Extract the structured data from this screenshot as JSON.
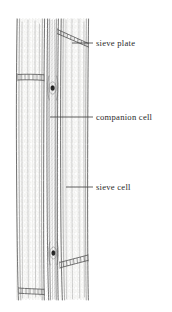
{
  "figure": {
    "background_color": "#ffffff",
    "ink_color": "#4a4a4a",
    "label_color": "#2b2b2b",
    "width": 172,
    "height": 312
  },
  "labels": [
    {
      "id": "sieve-plate",
      "text": "sieve plate",
      "text_x": 96,
      "text_y": 46,
      "leader": {
        "x1": 72,
        "y1": 43,
        "x2": 93,
        "y2": 43
      }
    },
    {
      "id": "companion-cell",
      "text": "companion cell",
      "text_x": 96,
      "text_y": 120,
      "leader": {
        "x1": 50,
        "y1": 117,
        "x2": 93,
        "y2": 117
      }
    },
    {
      "id": "sieve-cell",
      "text": "sieve cell",
      "text_x": 96,
      "text_y": 190,
      "leader": {
        "x1": 66,
        "y1": 187,
        "x2": 93,
        "y2": 187
      }
    }
  ],
  "structures": {
    "left_sieve_cell": {
      "name": "sieve cell (left)",
      "x_range": [
        16,
        45
      ],
      "y_range": [
        18,
        300
      ]
    },
    "companion_cell": {
      "name": "companion cell",
      "x_range": [
        46,
        59
      ],
      "y_range": [
        18,
        300
      ]
    },
    "right_sieve_cell": {
      "name": "sieve cell (right)",
      "x_range": [
        60,
        89
      ],
      "y_range": [
        18,
        300
      ]
    },
    "sieve_plates": [
      {
        "id": "plate-top-right",
        "orientation": "diagonal",
        "x": 58,
        "y": 30
      },
      {
        "id": "plate-upper-left",
        "orientation": "horizontal",
        "x": 18,
        "y": 77
      },
      {
        "id": "plate-lower-right",
        "orientation": "diagonal",
        "x": 60,
        "y": 264
      },
      {
        "id": "plate-bottom-left",
        "orientation": "horizontal",
        "x": 19,
        "y": 292
      }
    ],
    "nuclei": [
      {
        "id": "nucleus-upper",
        "x": 52.5,
        "y": 88
      },
      {
        "id": "nucleus-lower",
        "x": 53.5,
        "y": 253
      }
    ]
  }
}
